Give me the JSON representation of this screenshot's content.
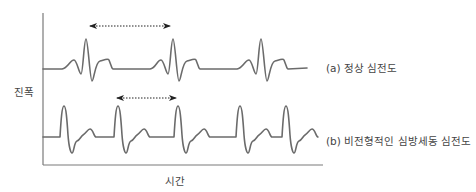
{
  "diagram": {
    "title": "",
    "axes": {
      "y_label": "진폭",
      "x_label": "시간"
    },
    "traces": [
      {
        "id": "a",
        "label": "(a) 정상 심전도",
        "description": "normal ECG with regular RR interval",
        "beat_peaks_x": [
          86,
          173,
          260
        ],
        "interval_arrow": {
          "from_x": 88,
          "to_x": 172,
          "y": 26,
          "style": "dotted double-headed"
        }
      },
      {
        "id": "b",
        "label": "(b) 비전형적인 심방세동 심전도",
        "description": "atypical atrial fibrillation ECG with irregular RR intervals",
        "beat_peaks_x": [
          64,
          118,
          178,
          240,
          286
        ],
        "interval_arrow": {
          "from_x": 115,
          "to_x": 178,
          "y": 98,
          "style": "dotted double-headed"
        }
      }
    ],
    "colors": {
      "trace": "#6b6b6b",
      "axis": "#7a7a7a",
      "arrow": "#222222",
      "text": "#444444"
    }
  }
}
